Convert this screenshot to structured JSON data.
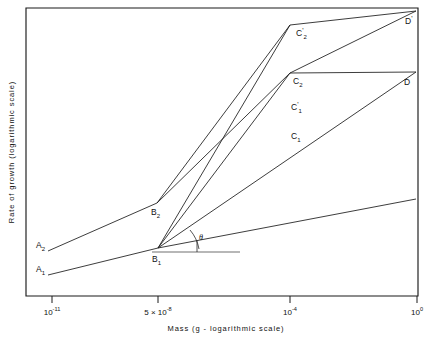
{
  "chart_data": {
    "type": "line",
    "title": "",
    "xlabel": "Mass (g - logarithmic scale)",
    "ylabel": "Rate of growth (logarithmic scale)",
    "x_scale": "logarithmic",
    "y_scale": "logarithmic",
    "grid": false,
    "legend": "none",
    "x_ticks": [
      {
        "mantissa": "10",
        "exponent": "-11",
        "prefix": "",
        "px": 52
      },
      {
        "mantissa": "10",
        "exponent": "-8",
        "prefix": "5 × ",
        "px": 158
      },
      {
        "mantissa": "10",
        "exponent": "-4",
        "prefix": "",
        "px": 290
      },
      {
        "mantissa": "10",
        "exponent": "0",
        "prefix": "",
        "px": 417
      }
    ],
    "annotations": [
      {
        "name": "A2",
        "base": "A",
        "sub": "2",
        "prime": "",
        "x": 36,
        "y": 248
      },
      {
        "name": "A1",
        "base": "A",
        "sub": "1",
        "prime": "",
        "x": 36,
        "y": 272
      },
      {
        "name": "B2",
        "base": "B",
        "sub": "2",
        "prime": "",
        "x": 151,
        "y": 215
      },
      {
        "name": "B1",
        "base": "B",
        "sub": "1",
        "prime": "",
        "x": 152,
        "y": 262
      },
      {
        "name": "C2prime",
        "base": "C",
        "sub": "2",
        "prime": "'",
        "x": 296,
        "y": 36
      },
      {
        "name": "C2",
        "base": "C",
        "sub": "2",
        "prime": "",
        "x": 293,
        "y": 84
      },
      {
        "name": "C1prime",
        "base": "C",
        "sub": "1",
        "prime": "'",
        "x": 291,
        "y": 110
      },
      {
        "name": "C1",
        "base": "C",
        "sub": "1",
        "prime": "",
        "x": 291,
        "y": 139
      },
      {
        "name": "Dprime",
        "base": "D",
        "sub": "",
        "prime": "'",
        "x": 405,
        "y": 24
      },
      {
        "name": "D",
        "base": "D",
        "sub": "",
        "prime": "",
        "x": 404,
        "y": 85
      }
    ],
    "angle_label": "θ",
    "series": [
      {
        "name": "A2-B2-C2prime-Dprime",
        "label": "upper growth trajectory (A₂ → B₂ → C₂' → D')",
        "points_px": [
          [
            48,
            251
          ],
          [
            157,
            203
          ],
          [
            290,
            25
          ],
          [
            416,
            11
          ]
        ]
      },
      {
        "name": "A1-B1-C1prime-D",
        "label": "lower growth trajectory (A₁ → B₁ → C₁' → D)",
        "points_px": [
          [
            48,
            275
          ],
          [
            158,
            248
          ],
          [
            290,
            73
          ],
          [
            416,
            72
          ]
        ]
      },
      {
        "name": "B2-C2-Dprime",
        "label": "B₂ → C₂ → D'",
        "points_px": [
          [
            157,
            203
          ],
          [
            290,
            73
          ],
          [
            416,
            11
          ]
        ]
      },
      {
        "name": "B1-C1-D",
        "label": "B₁ → C₁ → D",
        "points_px": [
          [
            158,
            248
          ],
          [
            416,
            72
          ]
        ]
      },
      {
        "name": "B1-shallow",
        "label": "B₁ shallow slope line",
        "points_px": [
          [
            158,
            248
          ],
          [
            416,
            199
          ]
        ]
      },
      {
        "name": "B1-steep-to-C2prime-knee",
        "label": "B₁ steep line to C₂' knee region",
        "points_px": [
          [
            158,
            248
          ],
          [
            290,
            25
          ]
        ]
      }
    ],
    "reference_line": {
      "name": "horizontal-reference-at-B1",
      "points_px": [
        [
          152,
          252
        ],
        [
          240,
          252
        ]
      ]
    },
    "frame_px": {
      "left": 26,
      "top": 8,
      "right": 418,
      "bottom": 296
    }
  },
  "figure": {
    "background_color": "#ffffff",
    "ink_color": "#1a1a1a"
  }
}
